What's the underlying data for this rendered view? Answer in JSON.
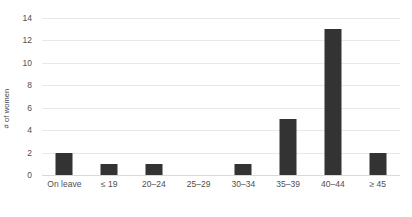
{
  "chart_data": {
    "type": "bar",
    "title": "",
    "xlabel": "",
    "ylabel": "# of women",
    "categories": [
      "On leave",
      "≤ 19",
      "20–24",
      "25–29",
      "30–34",
      "35–39",
      "40–44",
      "≥ 45"
    ],
    "values": [
      2,
      1,
      1,
      0,
      1,
      5,
      13,
      2
    ],
    "ylim": [
      0,
      14
    ],
    "y_ticks": [
      0,
      2,
      4,
      6,
      8,
      10,
      12,
      14
    ],
    "y_tick_labels": [
      "0",
      "2",
      "4",
      "6",
      "8",
      "10",
      "12",
      "14"
    ],
    "grid": true,
    "legend": "none",
    "bar_color": "#333333",
    "gridline_color": "#e8e8e8",
    "axis_text_color": "#4f4f4f",
    "background_color": "#ffffff"
  }
}
